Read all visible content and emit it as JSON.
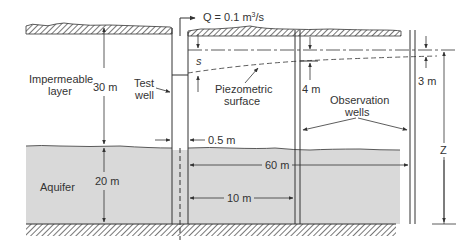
{
  "diagram": {
    "colors": {
      "aquifer_fill": "#d9d9d9",
      "line": "#333333",
      "hatch": "#555555",
      "background": "#ffffff"
    },
    "labels": {
      "impermeable_layer_line1": "Impermeable",
      "impermeable_layer_line2": "layer",
      "impermeable_thickness": "30 m",
      "test_well_line1": "Test",
      "test_well_line2": "well",
      "discharge_Q": "Q = 0.1 m",
      "discharge_exp": "3",
      "discharge_unit": "/s",
      "drawdown_s": "s",
      "piezometric_line1": "Piezometric",
      "piezometric_line2": "surface",
      "drawdown_near": "4 m",
      "drawdown_far": "3 m",
      "observation_line1": "Observation",
      "observation_line2": "wells",
      "well_diameter": "0.5 m",
      "aquifer": "Aquifer",
      "aquifer_thickness": "20 m",
      "dist_far": "60 m",
      "dist_near": "10 m",
      "Z": "Z"
    }
  }
}
